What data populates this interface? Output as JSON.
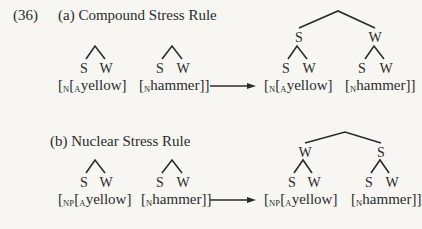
{
  "example_number": "(36)",
  "sections": [
    {
      "id": "a",
      "heading": "(a) Compound Stress Rule",
      "input": {
        "trees": [
          {
            "labels": [
              "S",
              "W"
            ]
          },
          {
            "labels": [
              "S",
              "W"
            ]
          }
        ],
        "brackets": [
          {
            "open1": "[",
            "sub1": "N",
            "open2": "[",
            "sub2": "A",
            "word": "yellow",
            "close": "]"
          },
          {
            "open1": "[",
            "sub1": "N",
            "word": "hammer",
            "close": "]]"
          }
        ]
      },
      "arrow": "→",
      "output": {
        "top_labels": [
          "S",
          "W"
        ],
        "leaf_labels": [
          "S",
          "W",
          "S",
          "W"
        ],
        "brackets": [
          {
            "open1": "[",
            "sub1": "N",
            "open2": "[",
            "sub2": "A",
            "word": "yellow",
            "close": "]"
          },
          {
            "open1": "[",
            "sub1": "N",
            "word": "hammer",
            "close": "]]"
          }
        ]
      }
    },
    {
      "id": "b",
      "heading": "(b) Nuclear Stress Rule",
      "input": {
        "trees": [
          {
            "labels": [
              "S",
              "W"
            ]
          },
          {
            "labels": [
              "S",
              "W"
            ]
          }
        ],
        "brackets": [
          {
            "open1": "[",
            "sub1": "NP",
            "open2": "[",
            "sub2": "A",
            "word": "yellow",
            "close": "]"
          },
          {
            "open1": "[",
            "sub1": "N",
            "word": "hammer",
            "close": "]]"
          }
        ]
      },
      "arrow": "→",
      "output": {
        "top_labels": [
          "W",
          "S"
        ],
        "leaf_labels": [
          "S",
          "W",
          "S",
          "W"
        ],
        "brackets": [
          {
            "open1": "[",
            "sub1": "NP",
            "open2": "[",
            "sub2": "A",
            "word": "yellow",
            "close": "]"
          },
          {
            "open1": "[",
            "sub1": "N",
            "word": "hammer",
            "close": "]]"
          }
        ]
      }
    }
  ]
}
